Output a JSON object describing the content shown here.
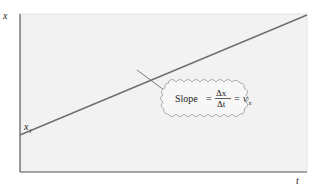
{
  "diagram": {
    "type": "position-time graph",
    "axes": {
      "y_label": "x",
      "x_label": "t"
    },
    "intercept_label": {
      "base": "x",
      "subscript": "i"
    },
    "callout": {
      "prefix": "Slope",
      "equals": "=",
      "numerator": "Δx",
      "denominator": "Δt",
      "result_base": "v",
      "result_subscript": "x"
    },
    "colors": {
      "plot_background": "#f2f2f2",
      "axis": "#555555",
      "line": "#6e6e6e",
      "cloud_fill": "#f7f7f7",
      "cloud_stroke": "#9a9a9a"
    }
  }
}
